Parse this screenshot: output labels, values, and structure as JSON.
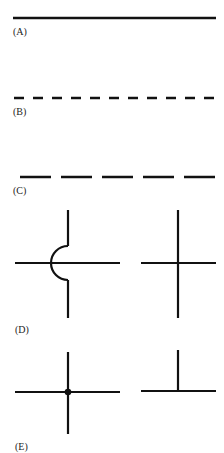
{
  "figure": {
    "panels": [
      {
        "id": "A",
        "label": "(A)",
        "description": "solid line"
      },
      {
        "id": "B",
        "label": "(B)",
        "description": "short dashed line"
      },
      {
        "id": "C",
        "label": "(C)",
        "description": "long dashed line"
      },
      {
        "id": "D",
        "label": "(D)",
        "description": "crossing wires: hop-over arc (left) and plain crossing (right)"
      },
      {
        "id": "E",
        "label": "(E)",
        "description": "connected wires: junction with dot (left) and T-junction (right)"
      }
    ],
    "colors": {
      "stroke": "#111111",
      "background": "#ffffff"
    }
  }
}
